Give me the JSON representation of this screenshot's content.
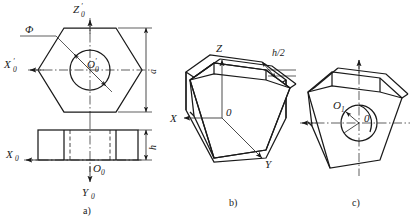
{
  "figure": {
    "background_color": "#ffffff",
    "line_color": "#1a1a1a",
    "width": 411,
    "height": 220
  },
  "views": [
    {
      "id": "view-a",
      "caption": "a)",
      "description": "orthographic-two-view-hex-prism",
      "labels": {
        "axis_z": "Z",
        "axis_z_prime": "′",
        "axis_z_sub": "0",
        "axis_x": "X",
        "axis_x_prime": "′",
        "axis_x_sub": "0",
        "origin_top": "O",
        "origin_top_prime": "′",
        "origin_top_sub": "0",
        "axis_x_front": "X",
        "axis_x_front_sub": "0",
        "axis_y_front": "Y",
        "axis_y_front_sub": "0",
        "origin_front": "O",
        "origin_front_sub": "0",
        "diameter": "Φ",
        "dim_across": "a",
        "dim_height": "h"
      }
    },
    {
      "id": "view-b",
      "caption": "b)",
      "description": "axonometric-hex-prism",
      "labels": {
        "axis_z": "Z",
        "axis_x": "X",
        "axis_y": "Y",
        "origin": "0",
        "dim_half_height": "h/2"
      }
    },
    {
      "id": "view-c",
      "caption": "c)",
      "description": "axonometric-hex-prism-with-circle",
      "labels": {
        "origin_1": "O",
        "origin_1_sub": "1",
        "origin": "0"
      }
    }
  ],
  "captions": {
    "a": "a)",
    "b": "b)",
    "c": "c)"
  }
}
